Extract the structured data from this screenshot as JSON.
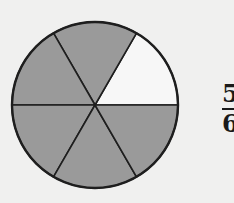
{
  "diagram": {
    "type": "fraction-circle",
    "total_parts": 6,
    "shaded_parts": 5,
    "unshaded_slice_index": 0,
    "colors": {
      "shaded": "#9a9a9a",
      "unshaded": "#f7f7f7",
      "stroke": "#1e1e1e",
      "background": "#f0f0ef"
    }
  },
  "fraction_label": {
    "numerator": "5",
    "denominator": "6"
  }
}
